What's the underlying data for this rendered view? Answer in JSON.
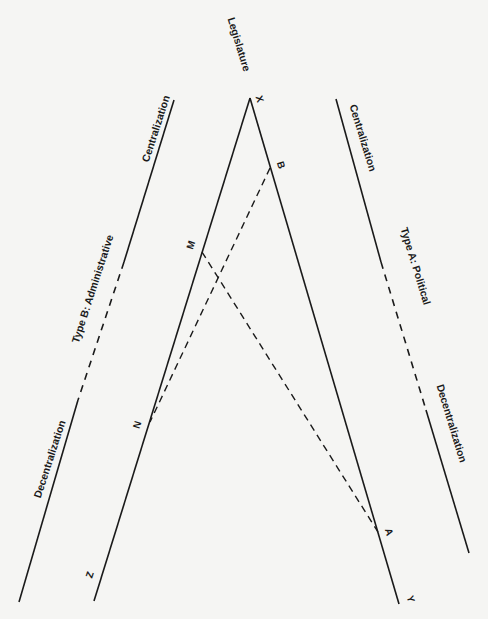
{
  "diagram": {
    "top_label": "Legislature",
    "left_axis": {
      "type_label": "Type B: Administrative",
      "top_label": "Centralization",
      "bottom_label": "Decentralization"
    },
    "right_axis": {
      "type_label": "Type A: Political",
      "top_label": "Centralization",
      "bottom_label": "Decentralization"
    },
    "points": {
      "apex": "X",
      "left_end": "Z",
      "right_end": "Y",
      "left_upper": "M",
      "left_lower": "N",
      "right_upper": "B",
      "right_lower": "A"
    },
    "colors": {
      "line": "#1a1a1a",
      "background": "#f5f5f3"
    }
  }
}
